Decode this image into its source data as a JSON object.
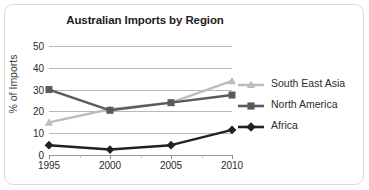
{
  "chart_data": {
    "type": "line",
    "title": "Australian Imports by Region",
    "xlabel": "",
    "ylabel": "% of Imports",
    "categories": [
      "1995",
      "2000",
      "2005",
      "2010"
    ],
    "x": [
      1995,
      2000,
      2005,
      2010
    ],
    "ylim": [
      0,
      50
    ],
    "yticks": [
      0,
      10,
      20,
      30,
      40,
      50
    ],
    "grid": true,
    "legend_position": "right",
    "series": [
      {
        "name": "South East Asia",
        "values": [
          15,
          21,
          24,
          34
        ],
        "color": "#bdbdbd",
        "marker": "triangle"
      },
      {
        "name": "North America",
        "values": [
          30,
          20.5,
          24,
          27.5
        ],
        "color": "#5a5a5a",
        "marker": "square"
      },
      {
        "name": "Africa",
        "values": [
          4.5,
          2.5,
          4.5,
          11.5
        ],
        "color": "#212121",
        "marker": "diamond"
      }
    ]
  },
  "yticks": {
    "t0": "0",
    "t1": "10",
    "t2": "20",
    "t3": "30",
    "t4": "40",
    "t5": "50"
  },
  "xticks": {
    "t0": "1995",
    "t1": "2000",
    "t2": "2005",
    "t3": "2010"
  },
  "legend": {
    "items": [
      {
        "label": "South East Asia"
      },
      {
        "label": "North America"
      },
      {
        "label": "Africa"
      }
    ]
  }
}
